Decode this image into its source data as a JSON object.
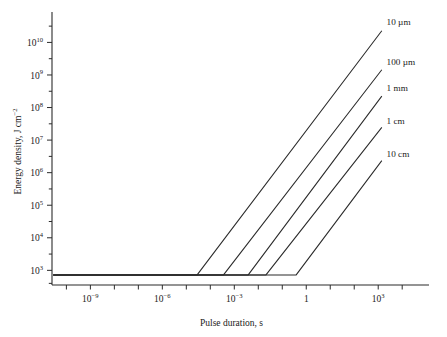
{
  "chart_data": {
    "type": "line",
    "title": "",
    "xlabel": "Pulse duration, s",
    "ylabel": "Energy density, J cm−2",
    "xscale": "log",
    "yscale": "log",
    "xlim": [
      -10.6,
      4.2
    ],
    "ylim": [
      2.55,
      10.75
    ],
    "grid": false,
    "legend_position": "right-inline-labels",
    "x_ticks": [
      {
        "value": -9,
        "label": "10",
        "exponent": "−9"
      },
      {
        "value": -6,
        "label": "10",
        "exponent": "−6"
      },
      {
        "value": -3,
        "label": "10",
        "exponent": "−3"
      },
      {
        "value": 0,
        "label": "1",
        "exponent": ""
      },
      {
        "value": 3,
        "label": "10",
        "exponent": "3"
      }
    ],
    "x_minor_ticks": [
      -10,
      -9,
      -8,
      -7,
      -6,
      -5,
      -4,
      -3,
      -2,
      -1,
      0,
      1,
      2,
      3,
      4
    ],
    "y_ticks": [
      {
        "value": 3,
        "label": "10",
        "exponent": "3"
      },
      {
        "value": 4,
        "label": "10",
        "exponent": "4"
      },
      {
        "value": 5,
        "label": "10",
        "exponent": "5"
      },
      {
        "value": 6,
        "label": "10",
        "exponent": "6"
      },
      {
        "value": 7,
        "label": "10",
        "exponent": "7"
      },
      {
        "value": 8,
        "label": "10",
        "exponent": "8"
      },
      {
        "value": 9,
        "label": "10",
        "exponent": "9"
      },
      {
        "value": 10,
        "label": "10",
        "exponent": "10"
      }
    ],
    "y_minor_ticks": [
      2.6,
      3.5,
      4.5,
      5.5,
      6.5,
      7.5,
      8.5,
      9.5,
      10.5
    ],
    "plateau_log_y": 2.86,
    "plateau_start_log_x": -10.55,
    "series": [
      {
        "name": "10 µm",
        "label": "10 µm",
        "knee_log_x": -4.55,
        "slope": 0.5,
        "end_log_x": 3.15,
        "end_log_y": 10.36,
        "label_log_x": 3.35,
        "label_log_y": 10.62
      },
      {
        "name": "100 µm",
        "label": "100 µm",
        "knee_log_x": -3.45,
        "slope": 0.5,
        "end_log_x": 3.15,
        "end_log_y": 9.16,
        "label_log_x": 3.35,
        "label_log_y": 9.42
      },
      {
        "name": "1 mm",
        "label": "1 mm",
        "knee_log_x": -2.42,
        "slope": 0.5,
        "end_log_x": 3.15,
        "end_log_y": 8.35,
        "label_log_x": 3.35,
        "label_log_y": 8.6
      },
      {
        "name": "1 cm",
        "label": "1 cm",
        "knee_log_x": -1.68,
        "slope": 0.5,
        "end_log_x": 3.15,
        "end_log_y": 7.39,
        "label_log_x": 3.35,
        "label_log_y": 7.58
      },
      {
        "name": "10 cm",
        "label": "10 cm",
        "knee_log_x": -0.42,
        "slope": 0.5,
        "end_log_x": 3.15,
        "end_log_y": 6.37,
        "label_log_x": 3.35,
        "label_log_y": 6.58
      }
    ]
  }
}
